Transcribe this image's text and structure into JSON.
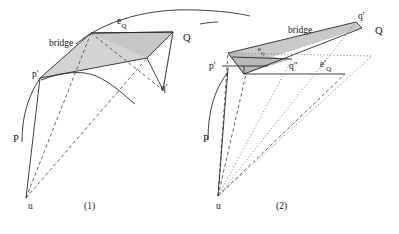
{
  "figure": {
    "caption_left": "(1)",
    "caption_right": "(2)",
    "colors": {
      "stroke": "#2b2b2b",
      "shade_light": "#d2d2d2",
      "shade_mid": "#b6b6b6",
      "shade_dark": "#9a9a9a",
      "background": "#ffffff"
    }
  },
  "panel1": {
    "labels": {
      "bridge": "bridge",
      "e_q_base": "e",
      "e_q_sub": "Q",
      "point_Q": "Q",
      "point_q_prime": "q'",
      "point_p_prime": "p'",
      "curve_P": "P",
      "apex_u": "u",
      "caption": "(1)"
    }
  },
  "panel2": {
    "labels": {
      "bridge": "bridge",
      "point_q_prime": "q'",
      "point_Q": "Q",
      "point_p_prime": "p'",
      "point_q_double_prime": "q''",
      "e_q_base": "e",
      "e_q_sub": "Q",
      "e_q_prime_base": "e'",
      "e_q_prime_sub": "Q",
      "curve_P": "P",
      "apex_u": "u",
      "caption": "(2)"
    }
  }
}
